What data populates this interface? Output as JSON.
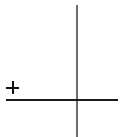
{
  "diagram": {
    "type": "axes-with-sign",
    "sign_symbol": "+",
    "vertical_axis": {
      "color": "#6e6e6e"
    },
    "horizontal_axis": {
      "color": "#1a1a1a"
    },
    "plus_color": "#111111",
    "background": "#ffffff"
  }
}
